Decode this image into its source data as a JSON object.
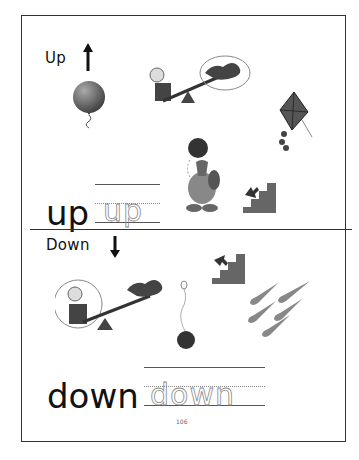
{
  "worksheet": {
    "page_number": "106",
    "up_section": {
      "heading": "Up",
      "arrow_icon": "arrow-up-icon",
      "model_word": "up",
      "trace_word": "up",
      "pictures": [
        {
          "name": "balloon",
          "icon": "balloon-icon"
        },
        {
          "name": "seesaw-child-up",
          "icon": "seesaw-icon"
        },
        {
          "name": "kite",
          "icon": "kite-icon"
        },
        {
          "name": "character-holding-ball",
          "icon": "character-icon"
        },
        {
          "name": "stairs-up",
          "icon": "stairs-up-icon"
        }
      ]
    },
    "down_section": {
      "heading": "Down",
      "arrow_icon": "arrow-down-icon",
      "model_word": "down",
      "trace_word": "down",
      "pictures": [
        {
          "name": "stairs-down",
          "icon": "stairs-down-icon"
        },
        {
          "name": "seesaw-child-down",
          "icon": "seesaw-icon"
        },
        {
          "name": "yoyo",
          "icon": "yoyo-icon"
        },
        {
          "name": "rain-drops",
          "icon": "rain-icon"
        }
      ]
    },
    "colors": {
      "border": "#333333",
      "ink": "#111111",
      "trace": "#888888",
      "illustration": "#555555"
    }
  }
}
